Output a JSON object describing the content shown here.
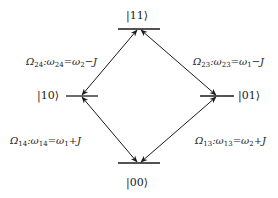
{
  "diagram": {
    "type": "energy-level-diagram",
    "levels": [
      {
        "id": "11",
        "label": "|11⟩",
        "position": "top"
      },
      {
        "id": "10",
        "label": "|10⟩",
        "position": "left"
      },
      {
        "id": "01",
        "label": "|01⟩",
        "position": "right"
      },
      {
        "id": "00",
        "label": "|00⟩",
        "position": "bottom"
      }
    ],
    "transitions": [
      {
        "from": "10",
        "to": "11",
        "rabi": "Ω",
        "rabi_sub": "24",
        "freq": "ω",
        "freq_sub": "24",
        "eq": "=ω",
        "eq_sub": "2",
        "tail": "−J"
      },
      {
        "from": "01",
        "to": "11",
        "rabi": "Ω",
        "rabi_sub": "23",
        "freq": "ω",
        "freq_sub": "23",
        "eq": "=ω",
        "eq_sub": "1",
        "tail": "−J"
      },
      {
        "from": "00",
        "to": "10",
        "rabi": "Ω",
        "rabi_sub": "14",
        "freq": "ω",
        "freq_sub": "14",
        "eq": "=ω",
        "eq_sub": "1",
        "tail": "+J"
      },
      {
        "from": "00",
        "to": "01",
        "rabi": "Ω",
        "rabi_sub": "13",
        "freq": "ω",
        "freq_sub": "13",
        "eq": "=ω",
        "eq_sub": "2",
        "tail": "+J"
      }
    ],
    "colors": {
      "line": "#1a1a1a",
      "text": "#1a1a1a",
      "background": "#ffffff"
    }
  }
}
